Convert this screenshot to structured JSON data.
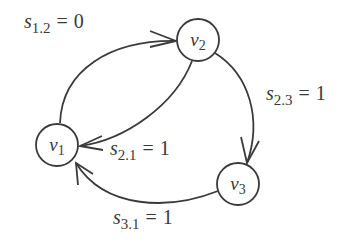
{
  "diagram": {
    "type": "directed-graph",
    "nodes": [
      {
        "id": "v1",
        "name": "v",
        "sub": "1"
      },
      {
        "id": "v2",
        "name": "v",
        "sub": "2"
      },
      {
        "id": "v3",
        "name": "v",
        "sub": "3"
      }
    ],
    "edges": [
      {
        "from": "v1",
        "to": "v2",
        "label": {
          "var": "s",
          "sub": "1.2",
          "eq": "=",
          "value": "0"
        }
      },
      {
        "from": "v2",
        "to": "v3",
        "label": {
          "var": "s",
          "sub": "2.3",
          "eq": "=",
          "value": "1"
        }
      },
      {
        "from": "v2",
        "to": "v1",
        "label": {
          "var": "s",
          "sub": "2.1",
          "eq": "=",
          "value": "1"
        }
      },
      {
        "from": "v3",
        "to": "v1",
        "label": {
          "var": "s",
          "sub": "3.1",
          "eq": "=",
          "value": "1"
        }
      }
    ],
    "colors": {
      "stroke": "#3a3a3a",
      "background": "#ffffff"
    }
  }
}
